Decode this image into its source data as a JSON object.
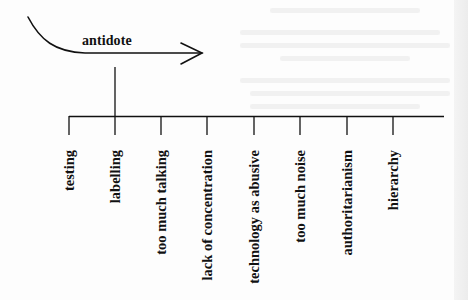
{
  "diagram": {
    "arrow": {
      "label": "antidote",
      "icon": "curved-arrow-right-icon"
    },
    "axis": {
      "items": [
        {
          "label": "testing",
          "x": 69
        },
        {
          "label": "labelling",
          "x": 115
        },
        {
          "label": "too much talking",
          "x": 161
        },
        {
          "label": "lack of concentration",
          "x": 207
        },
        {
          "label": "technology as abusive",
          "x": 254
        },
        {
          "label": "too much noise",
          "x": 300
        },
        {
          "label": "authoritarianism",
          "x": 347
        },
        {
          "label": "hierarchy",
          "x": 393
        }
      ],
      "highlighted_item": "labelling"
    },
    "colors": {
      "ink": "#111111",
      "paper": "#fdfdfd"
    }
  }
}
